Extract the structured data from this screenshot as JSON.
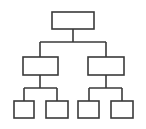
{
  "diagram": {
    "type": "hierarchy-tree",
    "icon": "org-chart-icon",
    "colors": {
      "stroke": "#3a3a3a",
      "fill": "#ffffff",
      "background": "#ffffff"
    },
    "levels": 3,
    "nodes": [
      {
        "id": "root",
        "level": 0,
        "label": ""
      },
      {
        "id": "child-left",
        "level": 1,
        "parent": "root",
        "label": ""
      },
      {
        "id": "child-right",
        "level": 1,
        "parent": "root",
        "label": ""
      },
      {
        "id": "leaf-1",
        "level": 2,
        "parent": "child-left",
        "label": ""
      },
      {
        "id": "leaf-2",
        "level": 2,
        "parent": "child-left",
        "label": ""
      },
      {
        "id": "leaf-3",
        "level": 2,
        "parent": "child-right",
        "label": ""
      },
      {
        "id": "leaf-4",
        "level": 2,
        "parent": "child-right",
        "label": ""
      }
    ]
  }
}
